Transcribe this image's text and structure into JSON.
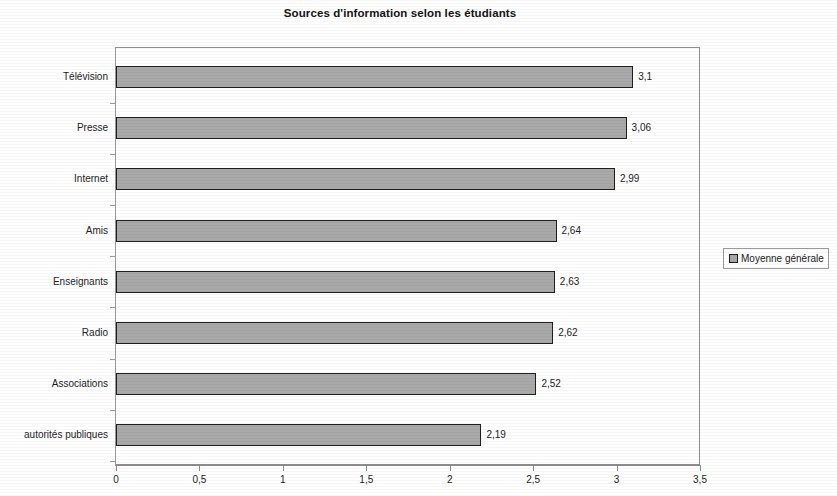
{
  "chart_data": {
    "type": "bar",
    "orientation": "horizontal",
    "title": "Sources d'information selon les étudiants",
    "xlabel": "",
    "ylabel": "",
    "categories": [
      "Télévision",
      "Presse",
      "Internet",
      "Amis",
      "Enseignants",
      "Radio",
      "Associations",
      "autorités publiques"
    ],
    "values": [
      3.1,
      3.06,
      2.99,
      2.64,
      2.63,
      2.62,
      2.52,
      2.19
    ],
    "value_labels": [
      "3,1",
      "3,06",
      "2,99",
      "2,64",
      "2,63",
      "2,62",
      "2,52",
      "2,19"
    ],
    "series": [
      {
        "name": "Moyenne générale",
        "values": [
          3.1,
          3.06,
          2.99,
          2.64,
          2.63,
          2.62,
          2.52,
          2.19
        ]
      }
    ],
    "xlim": [
      0,
      3.5
    ],
    "xticks": [
      0,
      0.5,
      1,
      1.5,
      2,
      2.5,
      3,
      3.5
    ],
    "xtick_labels": [
      "0",
      "0,5",
      "1",
      "1,5",
      "2",
      "2,5",
      "3",
      "3,5"
    ],
    "grid": false,
    "legend": {
      "position": "right",
      "entries": [
        {
          "label": "Moyenne générale",
          "color": "#a9a9a9"
        }
      ]
    },
    "colors": {
      "bar_fill": "#a9a9a9",
      "bar_border": "#1f1f1f",
      "axis": "#8e8e8e",
      "text": "#1c1c1c",
      "background": "#ffffff"
    }
  }
}
